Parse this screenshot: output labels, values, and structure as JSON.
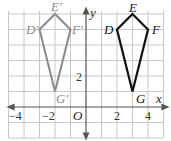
{
  "figure": {
    "x_axis_label": "x",
    "y_axis_label": "y",
    "origin_label": "O",
    "x_ticks": [
      {
        "value": -4,
        "label": "−4"
      },
      {
        "value": -2,
        "label": "−2"
      },
      {
        "value": 2,
        "label": "2"
      },
      {
        "value": 4,
        "label": "4"
      }
    ],
    "y_ticks": [
      {
        "value": 2,
        "label": "2"
      }
    ],
    "grid": {
      "x_min": -5,
      "x_max": 5,
      "y_min": -2,
      "y_max": 6
    },
    "colors": {
      "grid": "#c8c8c8",
      "axis": "#555555",
      "original_shape": "#111111",
      "image_shape": "#8a8a8a"
    },
    "shapes": [
      {
        "name": "DEFG",
        "role": "original",
        "vertices": [
          {
            "label": "D",
            "x": 2,
            "y": 5
          },
          {
            "label": "E",
            "x": 3,
            "y": 6
          },
          {
            "label": "F",
            "x": 4,
            "y": 5
          },
          {
            "label": "G",
            "x": 3,
            "y": 1
          }
        ]
      },
      {
        "name": "D'E'F'G'",
        "role": "translated",
        "vertices": [
          {
            "label": "D′",
            "x": -3,
            "y": 5
          },
          {
            "label": "E′",
            "x": -2,
            "y": 6
          },
          {
            "label": "F′",
            "x": -1,
            "y": 5
          },
          {
            "label": "G′",
            "x": -2,
            "y": 1
          }
        ]
      }
    ]
  }
}
